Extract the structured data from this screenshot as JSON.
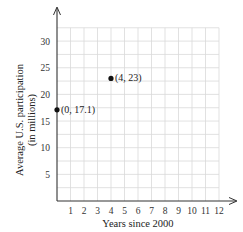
{
  "chart_data": {
    "type": "scatter",
    "title": "",
    "xlabel": "Years since 2000",
    "ylabel_line1": "Average U.S. participation",
    "ylabel_line2": "(in millions)",
    "xlim": [
      0,
      12
    ],
    "ylim": [
      0,
      32.5
    ],
    "grid": true,
    "x_ticks": [
      1,
      2,
      3,
      4,
      5,
      6,
      7,
      8,
      9,
      10,
      11,
      12
    ],
    "x_tick_labels": [
      "1",
      "2",
      "3",
      "4",
      "5",
      "6",
      "7",
      "8",
      "9",
      "10",
      "11",
      "12"
    ],
    "y_ticks": [
      5,
      10,
      15,
      20,
      25,
      30
    ],
    "y_tick_labels": [
      "5",
      "10",
      "15",
      "20",
      "25",
      "30"
    ],
    "points": [
      {
        "x": 0,
        "y": 17.1,
        "label": "(0, 17.1)"
      },
      {
        "x": 4,
        "y": 23,
        "label": "(4, 23)"
      }
    ],
    "colors": {
      "grid": "#d9d9d9",
      "axis": "#333333",
      "point": "#111111"
    }
  }
}
